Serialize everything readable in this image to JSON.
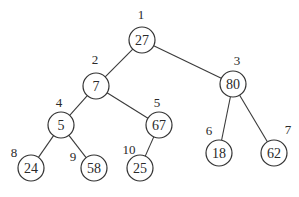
{
  "diagram": {
    "type": "binary-tree",
    "nodes": [
      {
        "index": "1",
        "value": "27",
        "cx": 142,
        "cy": 40,
        "lx": 141,
        "ly": 19
      },
      {
        "index": "2",
        "value": "7",
        "cx": 96,
        "cy": 86,
        "lx": 95,
        "ly": 64
      },
      {
        "index": "3",
        "value": "80",
        "cx": 233,
        "cy": 84,
        "lx": 237,
        "ly": 65
      },
      {
        "index": "4",
        "value": "5",
        "cx": 61,
        "cy": 125,
        "lx": 59,
        "ly": 107
      },
      {
        "index": "5",
        "value": "67",
        "cx": 159,
        "cy": 125,
        "lx": 157,
        "ly": 107
      },
      {
        "index": "6",
        "value": "18",
        "cx": 219,
        "cy": 153,
        "lx": 209,
        "ly": 135
      },
      {
        "index": "7",
        "value": "62",
        "cx": 274,
        "cy": 153,
        "lx": 288,
        "ly": 134
      },
      {
        "index": "8",
        "value": "24",
        "cx": 31,
        "cy": 168,
        "lx": 14,
        "ly": 157
      },
      {
        "index": "9",
        "value": "58",
        "cx": 94,
        "cy": 168,
        "lx": 73,
        "ly": 161
      },
      {
        "index": "10",
        "value": "25",
        "cx": 140,
        "cy": 168,
        "lx": 129,
        "ly": 154
      }
    ],
    "edges": [
      [
        "1",
        "2"
      ],
      [
        "1",
        "3"
      ],
      [
        "2",
        "4"
      ],
      [
        "2",
        "5"
      ],
      [
        "3",
        "6"
      ],
      [
        "3",
        "7"
      ],
      [
        "4",
        "8"
      ],
      [
        "4",
        "9"
      ],
      [
        "5",
        "10"
      ]
    ],
    "radius": 13
  }
}
